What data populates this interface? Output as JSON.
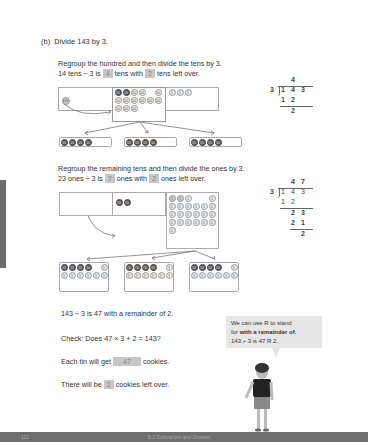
{
  "part_label": "(b)",
  "part_title": "Divide 143 by 3.",
  "step1": {
    "line1": "Regroup the hundred and then divide the tens by 3.",
    "line2_a": "14 tens ÷ 3 is",
    "answer1": "4",
    "line2_b": "tens with",
    "answer2": "2",
    "line2_c": "tens left over.",
    "hundreds_counter": "100",
    "tens_counter": "10",
    "ones_counter": "1"
  },
  "long_division_1": {
    "divisor": "3",
    "quotient": [
      "4"
    ],
    "dividend": [
      "1",
      "4",
      "3"
    ],
    "sub1": [
      "1",
      "2"
    ],
    "rem1": "2"
  },
  "step2": {
    "line1": "Regroup the remaining tens and then divide the ones by 3.",
    "line2_a": "23 ones ÷ 3 is",
    "answer1": "7",
    "line2_b": "ones with",
    "answer2": "2",
    "line2_c": "ones left over."
  },
  "long_division_2": {
    "divisor": "3",
    "quotient": [
      "4",
      "7"
    ],
    "dividend": [
      "1",
      "4",
      "3"
    ],
    "sub1": [
      "1",
      "2"
    ],
    "bring": [
      "2",
      "3"
    ],
    "sub2": [
      "2",
      "1"
    ],
    "rem": "2"
  },
  "result": "143 ÷ 3 is 47 with a remainder of 2.",
  "check": "Check: Does 47 × 3 + 2 = 143?",
  "tin_a": "Each tin will get",
  "tin_ans": "47",
  "tin_b": "cookies.",
  "left_a": "There will be",
  "left_ans": "2",
  "left_b": "cookies left over.",
  "bubble": {
    "line1": "We can use R to stand",
    "line2_a": "for ",
    "line2_b": "with a remainder of.",
    "line3": "143 ÷ 3 is 47 R 2."
  },
  "footer": {
    "page_number": "112",
    "chapter": "5.2 Subtraction and Division"
  }
}
